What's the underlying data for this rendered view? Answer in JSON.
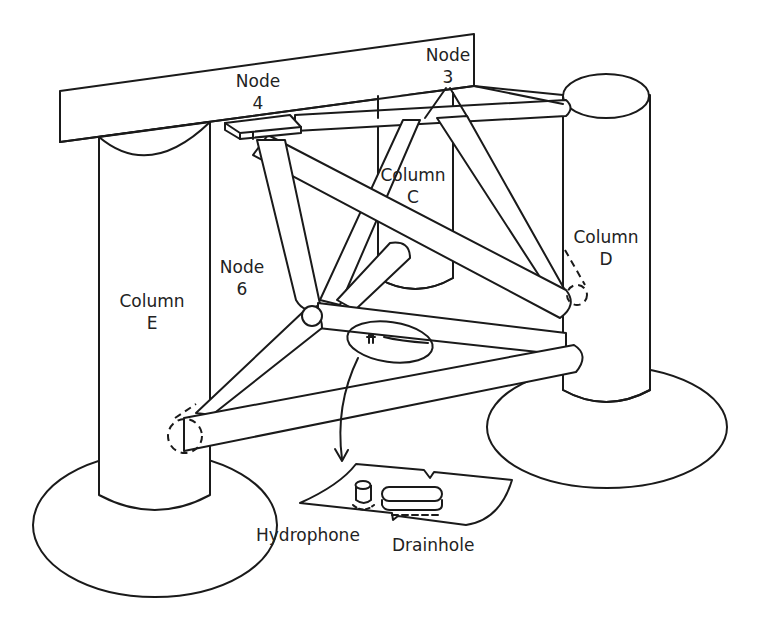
{
  "diagram": {
    "type": "structural-schematic",
    "colors": {
      "line": "#1a1a1a",
      "background": "#ffffff",
      "text": "#222222"
    },
    "labels": {
      "node3": {
        "line1": "Node",
        "line2": "3"
      },
      "node4": {
        "line1": "Node",
        "line2": "4"
      },
      "node6": {
        "line1": "Node",
        "line2": "6"
      },
      "columnC": {
        "line1": "Column",
        "line2": "C"
      },
      "columnD": {
        "line1": "Column",
        "line2": "D"
      },
      "columnE": {
        "line1": "Column",
        "line2": "E"
      },
      "hydrophone": "Hydrophone",
      "drainhole": "Drainhole"
    },
    "components": [
      "deck-beam",
      "column-C",
      "column-D",
      "column-E",
      "pontoon-D",
      "pontoon-E",
      "brace-members",
      "detail-ellipse",
      "detail-callout-arrow",
      "detail-inset"
    ]
  }
}
